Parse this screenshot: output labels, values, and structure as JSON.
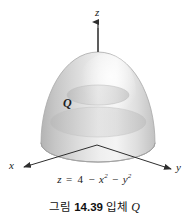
{
  "figure": {
    "axes": {
      "z_label": "z",
      "x_label": "x",
      "y_label": "y"
    },
    "solid_label": "Q",
    "equation": {
      "lhs": "z",
      "eq": "=",
      "term_const": "4",
      "minus1": "−",
      "term_x": "x",
      "exp_x": "2",
      "minus2": "−",
      "term_y": "y",
      "exp_y": "2",
      "full_text": "z = 4 − x2 − y2"
    },
    "caption": {
      "prefix": "그림",
      "number": "14.39",
      "middle": "입체",
      "variable": "Q",
      "full_text": "그림 14.39 입체 Q"
    },
    "colors": {
      "background": "#ffffff",
      "axis": "#3a3a3a",
      "text": "#1a1a1a",
      "surface_light": "#f2f2f2",
      "surface_mid": "#dcdcdc",
      "surface_dark": "#bfbfbf",
      "surface_edge": "#b0b0b0",
      "base_ellipse": "#c9c9c9"
    }
  }
}
